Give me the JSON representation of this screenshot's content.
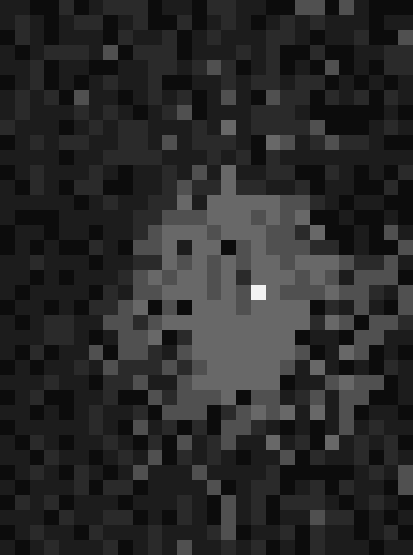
{
  "image": {
    "description": "Pixelated grayscale mosaic with a bright central cluster and a single near-white pixel",
    "cols": 28,
    "rows": 37,
    "palette": [
      "#0c0c0c",
      "#1c1c1c",
      "#2a2a2a",
      "#505050",
      "#686868",
      "#787878",
      "#f2f2f2"
    ],
    "rows_data": [
      "1100201222011022110033031000",
      "1210122012002012101212111011",
      "0210111021120121112210112003",
      "1012221302220111212002001122",
      "1120110011221232012010301022",
      "0120101211200112122122010101",
      "1212031101212013103220212021",
      "1211121210123011122210000010",
      "2111012122111214122223000121",
      "0121221122131222104312322100",
      "1111011222211121202111111111",
      "0121112101121314112200210102",
      "1021022001123224221120110020",
      "1111101211224144444332101100",
      "1000111112233344434340010010",
      "0110110112344434443324001031",
      "0101002103341440343332201003",
      "1121110112243434344344432231",
      "1101011123434434244434313330",
      "1011110213344434364333433213",
      "0110102234030444344440213103",
      "1012211332344444444442430332",
      "1112210133402444444401103311",
      "1020113033213444444430143010",
      "0101121322232344444314101021",
      "1112110223113444444011343301",
      "0120011200323334033123133001",
      "1101012112033302343414130110",
      "0111112103120203321010131211",
      "1021011210203123114120412120",
      "1102110121302121011302112021",
      "0121021013111311112000001213",
      "1011120220111130122012021103",
      "0212011101112103120222101210",
      "1110211220102103120113220101",
      "0121102111211123011202110120",
      "1012111201213112120102111011"
    ]
  }
}
